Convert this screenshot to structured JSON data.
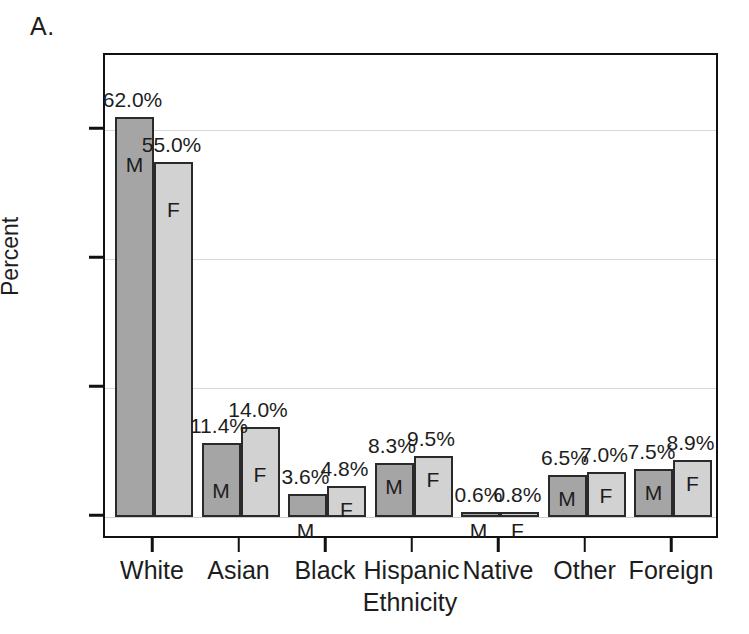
{
  "panel": {
    "label": "A."
  },
  "chart_data": {
    "type": "bar",
    "title": "",
    "subtitle": "",
    "xlabel": "Ethnicity",
    "ylabel": "Percent",
    "categories": [
      "White",
      "Asian",
      "Black",
      "Hispanic",
      "Native",
      "Other",
      "Foreign"
    ],
    "series": [
      {
        "name": "M",
        "legend": "Male",
        "color": "#a5a5a5",
        "values": [
          62.0,
          11.4,
          3.6,
          8.3,
          0.6,
          6.5,
          7.5
        ],
        "value_labels": [
          "62.0%",
          "11.4%",
          "3.6%",
          "8.3%",
          "0.6%",
          "6.5%",
          "7.5%"
        ],
        "bar_letter": "M"
      },
      {
        "name": "F",
        "legend": "Female",
        "color": "#d2d2d2",
        "values": [
          55.0,
          14.0,
          4.8,
          9.5,
          0.8,
          7.0,
          8.9
        ],
        "value_labels": [
          "55.0%",
          "14.0%",
          "4.8%",
          "9.5%",
          "0.8%",
          "7.0%",
          "8.9%"
        ],
        "bar_letter": "F"
      }
    ],
    "ylim": [
      0,
      75
    ],
    "yticks": [
      0,
      20,
      40,
      60
    ],
    "ytick_labels": [
      "0",
      "20",
      "40",
      "60"
    ],
    "grid": true,
    "grid_axis": "y",
    "legend_position": "none",
    "bar_labels_inside": true
  }
}
